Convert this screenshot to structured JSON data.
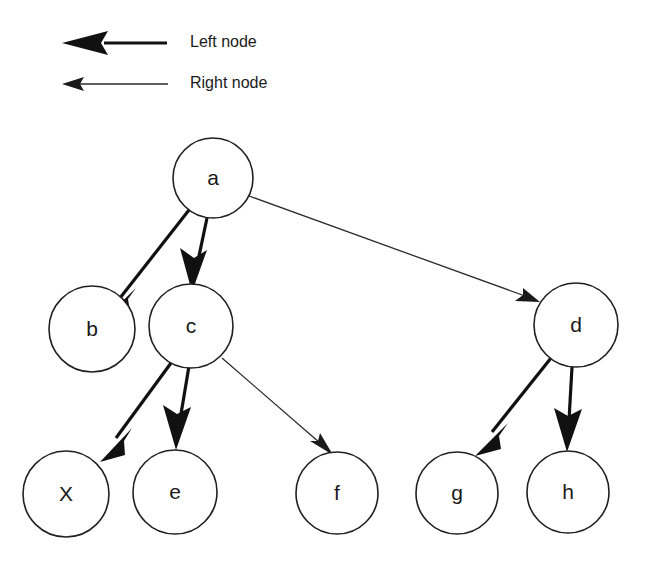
{
  "diagram": {
    "background_color": "#ffffff",
    "stroke_color": "#111111",
    "node_fill": "#ffffff"
  },
  "legend": {
    "items": [
      {
        "key": "left",
        "label": "Left node",
        "style": "thick-arrow",
        "icon": "arrow-left-thick-icon"
      },
      {
        "key": "right",
        "label": "Right node",
        "style": "thin-arrow",
        "icon": "arrow-left-thin-icon"
      }
    ]
  },
  "nodes": [
    {
      "id": "a",
      "label": "a",
      "cx": 213,
      "cy": 178,
      "r": 40
    },
    {
      "id": "b",
      "label": "b",
      "cx": 92,
      "cy": 329,
      "r": 43
    },
    {
      "id": "c",
      "label": "c",
      "cx": 191,
      "cy": 326,
      "r": 42
    },
    {
      "id": "d",
      "label": "d",
      "cx": 576,
      "cy": 325,
      "r": 42
    },
    {
      "id": "x",
      "label": "X",
      "cx": 66,
      "cy": 494,
      "r": 43
    },
    {
      "id": "e",
      "label": "e",
      "cx": 175,
      "cy": 492,
      "r": 42
    },
    {
      "id": "f",
      "label": "f",
      "cx": 337,
      "cy": 493,
      "r": 41
    },
    {
      "id": "g",
      "label": "g",
      "cx": 457,
      "cy": 493,
      "r": 41
    },
    {
      "id": "h",
      "label": "h",
      "cx": 568,
      "cy": 492,
      "r": 41
    }
  ],
  "edges": [
    {
      "id": "a-b",
      "from": "a",
      "to": "b",
      "kind": "left",
      "label": ""
    },
    {
      "id": "a-c",
      "from": "a",
      "to": "c",
      "kind": "left",
      "label": ""
    },
    {
      "id": "a-d",
      "from": "a",
      "to": "d",
      "kind": "right",
      "label": ""
    },
    {
      "id": "c-x",
      "from": "c",
      "to": "x",
      "kind": "left",
      "label": ""
    },
    {
      "id": "c-e",
      "from": "c",
      "to": "e",
      "kind": "left",
      "label": ""
    },
    {
      "id": "c-f",
      "from": "c",
      "to": "f",
      "kind": "right",
      "label": ""
    },
    {
      "id": "d-g",
      "from": "d",
      "to": "g",
      "kind": "left",
      "label": ""
    },
    {
      "id": "d-h",
      "from": "d",
      "to": "h",
      "kind": "left",
      "label": ""
    }
  ]
}
